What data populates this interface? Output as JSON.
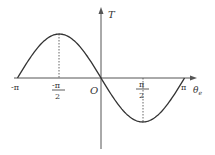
{
  "chart_data": {
    "type": "line",
    "title": "",
    "xlabel": "θe",
    "ylabel": "T",
    "origin_label": "O",
    "function": "T = -sin(θe)",
    "x_ticks": [
      {
        "value": -3.14159,
        "label_num": "-π",
        "label_den": ""
      },
      {
        "value": -1.5708,
        "label_num": "-π",
        "label_den": "2"
      },
      {
        "value": 1.5708,
        "label_num": "π",
        "label_den": "2"
      },
      {
        "value": 3.14159,
        "label_num": "π",
        "label_den": ""
      }
    ],
    "series": [
      {
        "name": "T",
        "x": [
          -3.14159,
          -2.35619,
          -1.5708,
          -0.7854,
          0,
          0.7854,
          1.5708,
          2.35619,
          3.14159
        ],
        "values": [
          0,
          0.707,
          1,
          0.707,
          0,
          -0.707,
          -1,
          -0.707,
          0
        ]
      }
    ],
    "annotations": [
      {
        "type": "dashed-drop-line",
        "x": -1.5708,
        "y": 1
      },
      {
        "type": "dashed-drop-line",
        "x": 1.5708,
        "y": -1
      }
    ],
    "xlim": [
      -3.14159,
      3.14159
    ],
    "ylim": [
      -1,
      1
    ],
    "grid": false,
    "legend": "none",
    "colors": {
      "curve": "#333333",
      "axis": "#555555",
      "text": "#333333"
    }
  },
  "labels": {
    "y_axis": "T",
    "x_axis_main": "θ",
    "x_axis_sub": "e",
    "origin": "O",
    "neg_pi": "-π",
    "neg_half_pi_num": "-π",
    "neg_half_pi_den": "2",
    "half_pi_num": "π",
    "half_pi_den": "2",
    "pi": "π"
  }
}
